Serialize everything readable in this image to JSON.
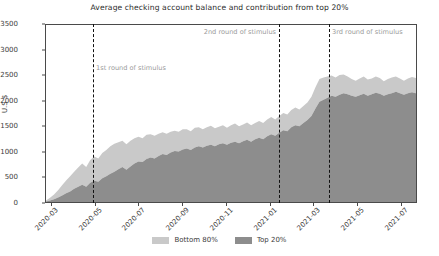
{
  "chart_data": {
    "type": "area",
    "stacked": true,
    "title": "Average checking account balance and contribution from top 20%",
    "xlabel": "",
    "ylabel": "U.S $",
    "ylim": [
      0,
      3500
    ],
    "ytick_values": [
      0,
      500,
      1000,
      1500,
      2000,
      2500,
      3000,
      3500
    ],
    "ytick_labels": [
      "0",
      "500",
      "1000",
      "1500",
      "2000",
      "2500",
      "3000",
      "3500"
    ],
    "xtick_labels": [
      "2020-03",
      "2020-05",
      "2020-07",
      "2020-09",
      "2020-11",
      "2021-01",
      "2021-03",
      "2021-05",
      "2021-07"
    ],
    "grid": false,
    "legend_position": "bottom-center",
    "colors": {
      "bottom_80": "#c9c9c9",
      "top_20": "#8d8d8d",
      "annotation_line": "#111111",
      "annotation_text": "#9b9b9b",
      "axis": "#4a4a4a"
    },
    "series": [
      {
        "name": "Top 20%",
        "color": "#8d8d8d",
        "values": [
          10,
          30,
          55,
          90,
          130,
          175,
          210,
          260,
          300,
          340,
          300,
          380,
          420,
          400,
          470,
          510,
          560,
          600,
          650,
          690,
          640,
          700,
          760,
          800,
          790,
          850,
          880,
          860,
          910,
          950,
          930,
          980,
          1010,
          1000,
          1040,
          1060,
          1030,
          1080,
          1100,
          1080,
          1110,
          1130,
          1100,
          1140,
          1160,
          1130,
          1170,
          1190,
          1160,
          1200,
          1230,
          1190,
          1240,
          1270,
          1240,
          1300,
          1340,
          1310,
          1370,
          1420,
          1400,
          1480,
          1520,
          1500,
          1560,
          1620,
          1700,
          1850,
          1980,
          2020,
          2060,
          2100,
          2080,
          2120,
          2150,
          2130,
          2100,
          2080,
          2110,
          2140,
          2100,
          2130,
          2160,
          2140,
          2100,
          2130,
          2150,
          2180,
          2150,
          2120,
          2150,
          2170,
          2150
        ]
      },
      {
        "name": "Bottom 80%",
        "color": "#c9c9c9",
        "values": [
          20,
          55,
          95,
          140,
          200,
          250,
          300,
          340,
          380,
          420,
          390,
          450,
          480,
          460,
          500,
          520,
          540,
          550,
          530,
          520,
          500,
          510,
          500,
          490,
          470,
          480,
          460,
          450,
          440,
          430,
          420,
          410,
          400,
          390,
          400,
          380,
          370,
          390,
          380,
          360,
          370,
          380,
          360,
          350,
          360,
          340,
          350,
          360,
          340,
          330,
          340,
          330,
          320,
          330,
          320,
          330,
          340,
          320,
          330,
          340,
          330,
          340,
          350,
          330,
          340,
          350,
          380,
          420,
          450,
          440,
          420,
          400,
          380,
          390,
          370,
          350,
          330,
          320,
          330,
          340,
          320,
          310,
          320,
          310,
          290,
          300,
          310,
          300,
          290,
          280,
          290,
          300,
          300
        ]
      }
    ],
    "annotations": [
      {
        "id": "stimulus-1",
        "label": "1st round of stimulus",
        "align": "left"
      },
      {
        "id": "stimulus-2",
        "label": "2nd round of stimulus",
        "align": "right"
      },
      {
        "id": "stimulus-3",
        "label": "3rd round of stimulus",
        "align": "left"
      }
    ]
  }
}
